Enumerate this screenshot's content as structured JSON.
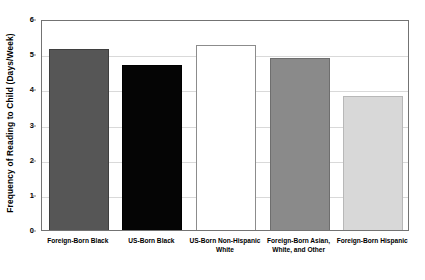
{
  "chart_data": {
    "type": "bar",
    "title": "",
    "subtitle": "",
    "xlabel": "",
    "ylabel": "Frequency of Reading to Child (Days/Week)",
    "ylim": [
      0,
      6
    ],
    "ytick_labels": [
      "0",
      "1",
      "2",
      "3",
      "4",
      "5",
      "6"
    ],
    "ytick_values": [
      0,
      1,
      2,
      3,
      4,
      5,
      6
    ],
    "grid": true,
    "legend": "none",
    "categories": [
      "Foreign-Born Black",
      "US-Born Black",
      "US-Born Non-Hispanic White",
      "Foreign-Born Asian, White, and Other",
      "Foreign-Born Hispanic"
    ],
    "category_label_lines": [
      [
        "Foreign-Born Black"
      ],
      [
        "US-Born Black"
      ],
      [
        "US-Born Non-Hispanic",
        "White"
      ],
      [
        "Foreign-Born Asian,",
        "White, and Other"
      ],
      [
        "Foreign-Born Hispanic"
      ]
    ],
    "values": [
      5.15,
      4.68,
      5.25,
      4.88,
      3.82
    ],
    "bar_colors": [
      "#565656",
      "#050505",
      "#ffffff",
      "#8a8a8a",
      "#d8d8d8"
    ],
    "bar_border_colors": [
      "#3f3f3f",
      "#000000",
      "#8c8c8c",
      "#6e6e6e",
      "#b8b8b8"
    ]
  },
  "axis": {
    "plot_border_color": "#737373",
    "gridline_color": "#d9d9d9",
    "tick_mark_color": "#808080"
  }
}
